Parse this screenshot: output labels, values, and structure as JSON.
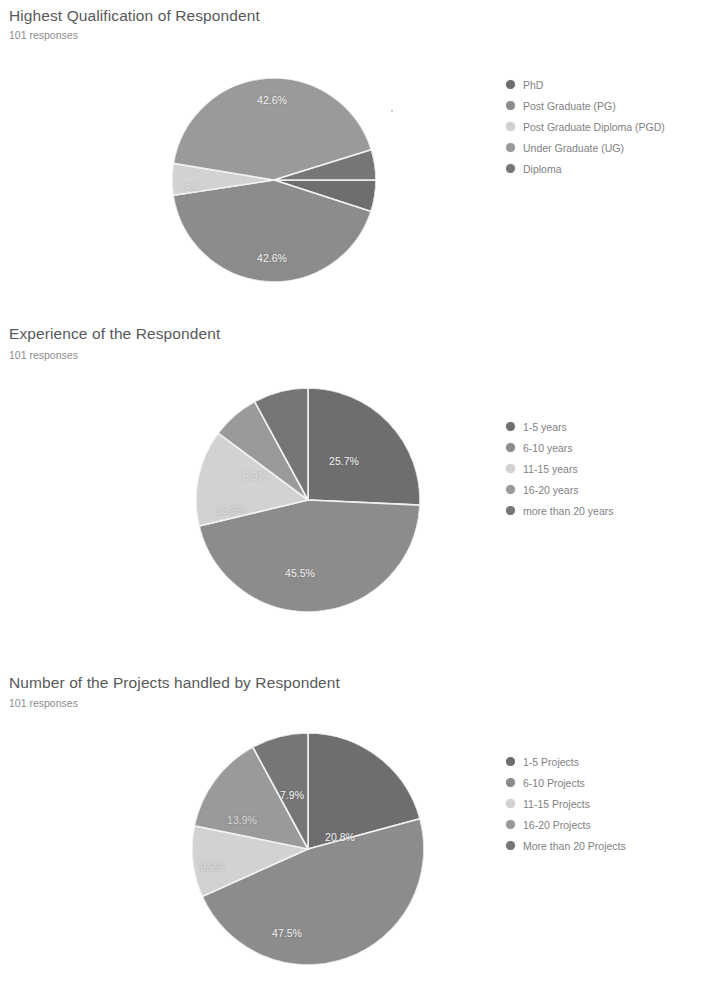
{
  "page": {
    "background": "#ffffff",
    "text_color": "#5f6368"
  },
  "sections": [
    {
      "title": "Highest Qualification of Respondent",
      "responses": "101 responses"
    },
    {
      "title": "Experience of the Respondent",
      "responses": "101 responses"
    },
    {
      "title": "Number of the Projects handled by Respondent",
      "responses": "101 responses"
    }
  ],
  "legends": [
    {
      "items": [
        {
          "label": "PhD",
          "color": "#6e6e6e"
        },
        {
          "label": "Post Graduate (PG)",
          "color": "#8c8c8c"
        },
        {
          "label": "Post Graduate Diploma (PGD)",
          "color": "#d2d2d2"
        },
        {
          "label": "Under Graduate (UG)",
          "color": "#9a9a9a"
        },
        {
          "label": "Diploma",
          "color": "#767676"
        }
      ]
    },
    {
      "items": [
        {
          "label": "1-5 years",
          "color": "#6e6e6e"
        },
        {
          "label": "6-10 years",
          "color": "#8c8c8c"
        },
        {
          "label": "11-15 years",
          "color": "#d2d2d2"
        },
        {
          "label": "16-20 years",
          "color": "#9a9a9a"
        },
        {
          "label": "more than 20 years",
          "color": "#767676"
        }
      ]
    },
    {
      "items": [
        {
          "label": "1-5 Projects",
          "color": "#6e6e6e"
        },
        {
          "label": "6-10 Projects",
          "color": "#8c8c8c"
        },
        {
          "label": "11-15 Projects",
          "color": "#d2d2d2"
        },
        {
          "label": "16-20 Projects",
          "color": "#9a9a9a"
        },
        {
          "label": "More than 20 Projects",
          "color": "#767676"
        }
      ]
    }
  ],
  "chart_data": [
    {
      "type": "pie",
      "title": "Highest Qualification of Respondent",
      "subtitle": "101 responses",
      "legend_position": "right",
      "categories": [
        "PhD",
        "Post Graduate (PG)",
        "Post Graduate Diploma (PGD)",
        "Under Graduate (UG)",
        "Diploma"
      ],
      "values": [
        5.0,
        42.6,
        5.0,
        42.6,
        4.8
      ],
      "value_unit": "percent",
      "labels": [
        "",
        "42.6%",
        "5%",
        "42.6%",
        ""
      ],
      "colors": [
        "#6e6e6e",
        "#8c8c8c",
        "#d2d2d2",
        "#9a9a9a",
        "#767676"
      ]
    },
    {
      "type": "pie",
      "title": "Experience of the Respondent",
      "subtitle": "101 responses",
      "legend_position": "right",
      "categories": [
        "1-5 years",
        "6-10 years",
        "11-15 years",
        "16-20 years",
        "more than 20 years"
      ],
      "values": [
        25.7,
        45.5,
        13.9,
        6.9,
        7.9
      ],
      "value_unit": "percent",
      "labels": [
        "25.7%",
        "45.5%",
        "13.9%",
        "6.9%",
        ""
      ],
      "colors": [
        "#6e6e6e",
        "#8c8c8c",
        "#d2d2d2",
        "#9a9a9a",
        "#767676"
      ]
    },
    {
      "type": "pie",
      "title": "Number of the Projects handled by Respondent",
      "subtitle": "101 responses",
      "legend_position": "right",
      "categories": [
        "1-5 Projects",
        "6-10 Projects",
        "11-15 Projects",
        "16-20 Projects",
        "More than 20 Projects"
      ],
      "values": [
        20.8,
        47.5,
        9.9,
        13.9,
        7.9
      ],
      "value_unit": "percent",
      "labels": [
        "20.8%",
        "47.5%",
        "9.9%",
        "13.9%",
        "7.9%"
      ],
      "colors": [
        "#6e6e6e",
        "#8c8c8c",
        "#d2d2d2",
        "#9a9a9a",
        "#767676"
      ]
    }
  ]
}
